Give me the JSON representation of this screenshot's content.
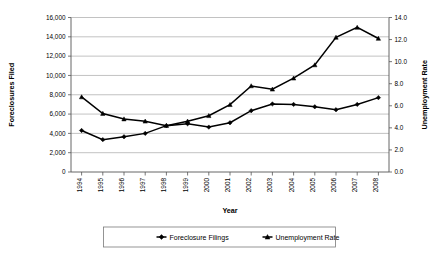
{
  "chart_data": {
    "type": "line",
    "title": "",
    "xlabel": "Year",
    "ylabel": "Foreclosures Filed",
    "y2label": "Unemployment Rate",
    "categories": [
      "1994",
      "1995",
      "1996",
      "1997",
      "1998",
      "1999",
      "2000",
      "2001",
      "2002",
      "2003",
      "2004",
      "2005",
      "2006",
      "2007",
      "2008"
    ],
    "ylim": [
      0,
      16000
    ],
    "y2lim": [
      0.0,
      14.0
    ],
    "yticks": [
      "0",
      "2,000",
      "4,000",
      "6,000",
      "8,000",
      "10,000",
      "12,000",
      "14,000",
      "16,000"
    ],
    "ytick_values": [
      0,
      2000,
      4000,
      6000,
      8000,
      10000,
      12000,
      14000,
      16000
    ],
    "y2ticks": [
      "0.0",
      "2.0",
      "4.0",
      "6.0",
      "8.0",
      "10.0",
      "12.0",
      "14.0"
    ],
    "y2tick_values": [
      0.0,
      2.0,
      4.0,
      6.0,
      8.0,
      10.0,
      12.0,
      14.0
    ],
    "grid": true,
    "legend_position": "bottom",
    "series": [
      {
        "name": "Foreclosure Filings",
        "axis": "left",
        "marker": "diamond",
        "color": "#000000",
        "values": [
          4300,
          3350,
          3650,
          4000,
          4800,
          5000,
          4650,
          5100,
          6350,
          7050,
          7000,
          6750,
          6450,
          7000,
          7700
        ]
      },
      {
        "name": "Unemployment Rate",
        "axis": "right",
        "marker": "triangle",
        "color": "#000000",
        "values": [
          6.8,
          5.3,
          4.8,
          4.6,
          4.2,
          4.6,
          5.1,
          6.1,
          7.8,
          7.5,
          8.5,
          9.7,
          12.2,
          13.1,
          12.1
        ]
      }
    ]
  },
  "axes": {
    "x_title": "Year",
    "y_left_title": "Foreclosures Filed",
    "y_right_title": "Unemployment Rate"
  },
  "legend": {
    "items": [
      {
        "label": "Foreclosure Filings",
        "marker": "diamond"
      },
      {
        "label": "Unemployment Rate",
        "marker": "triangle"
      }
    ]
  }
}
